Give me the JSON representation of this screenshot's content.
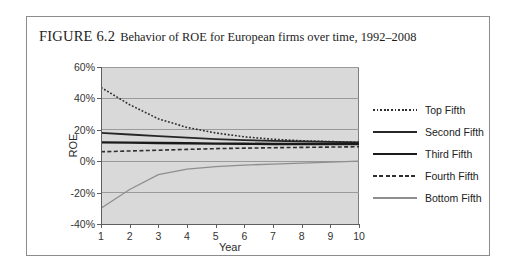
{
  "figure": {
    "label": "FIGURE 6.2",
    "caption": "Behavior of ROE for European firms over time, 1992–2008"
  },
  "chart_data": {
    "type": "line",
    "title": "Behavior of ROE for European firms over time, 1992–2008",
    "xlabel": "Year",
    "ylabel": "ROE",
    "x": [
      1,
      2,
      3,
      4,
      5,
      6,
      7,
      8,
      9,
      10
    ],
    "xtick_labels": [
      "1",
      "2",
      "3",
      "4",
      "5",
      "6",
      "7",
      "8",
      "9",
      "10"
    ],
    "ytick_labels": [
      "60%",
      "40%",
      "20%",
      "0%",
      "-20%",
      "-40%"
    ],
    "ytick_values": [
      60,
      40,
      20,
      0,
      -20,
      -40
    ],
    "ylim": [
      -40,
      60
    ],
    "xlim": [
      1,
      10
    ],
    "grid": true,
    "grid_color": "#9a9a9a",
    "plot_background": "#d9d9d9",
    "legend_position": "right",
    "series": [
      {
        "name": "Top Fifth",
        "style": "dotted",
        "color": "#2f2f2f",
        "width": 1.6,
        "values": [
          47,
          36,
          27,
          21.5,
          18,
          15.5,
          14,
          13,
          12.5,
          12
        ]
      },
      {
        "name": "Second Fifth",
        "style": "solid",
        "color": "#262626",
        "width": 1.8,
        "values": [
          18,
          17,
          16,
          15,
          14,
          13.4,
          13,
          12.6,
          12.3,
          12
        ]
      },
      {
        "name": "Third Fifth",
        "style": "solid",
        "color": "#1a1a1a",
        "width": 2.4,
        "values": [
          12,
          11.8,
          11.6,
          11.4,
          11.2,
          11.1,
          11,
          11,
          11,
          11
        ]
      },
      {
        "name": "Fourth Fifth",
        "style": "dashed",
        "color": "#2f2f2f",
        "width": 1.6,
        "values": [
          6,
          6.5,
          7,
          7.5,
          8,
          8.3,
          8.6,
          8.8,
          9,
          9.2
        ]
      },
      {
        "name": "Bottom Fifth",
        "style": "solid",
        "color": "#8e8e8e",
        "width": 1.3,
        "values": [
          -30,
          -18,
          -8.5,
          -5,
          -3.5,
          -2.5,
          -1.8,
          -1.2,
          -0.6,
          0
        ]
      }
    ]
  }
}
